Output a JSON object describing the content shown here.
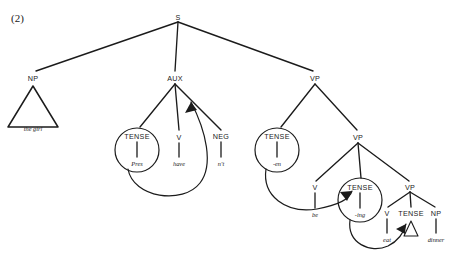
{
  "example": {
    "number": "(2)"
  },
  "tree": {
    "type": "syntax-tree",
    "description": "Phrase structure tree with affix hopping arrows",
    "nodes": [
      {
        "id": "s",
        "label": "S",
        "x": 178,
        "y": 17,
        "circled": false
      },
      {
        "id": "np",
        "label": "NP",
        "x": 33,
        "y": 78,
        "circled": false
      },
      {
        "id": "aux",
        "label": "AUX",
        "x": 175,
        "y": 78,
        "circled": false
      },
      {
        "id": "vp1",
        "label": "VP",
        "x": 315,
        "y": 78,
        "circled": false
      },
      {
        "id": "tense1",
        "label": "TENSE",
        "x": 137,
        "y": 136,
        "circled": true
      },
      {
        "id": "v1",
        "label": "V",
        "x": 179,
        "y": 137,
        "circled": false
      },
      {
        "id": "neg",
        "label": "NEG",
        "x": 221,
        "y": 136,
        "circled": false
      },
      {
        "id": "tense2",
        "label": "TENSE",
        "x": 277,
        "y": 136,
        "circled": true
      },
      {
        "id": "vp2",
        "label": "VP",
        "x": 358,
        "y": 137,
        "circled": false
      },
      {
        "id": "v2",
        "label": "V",
        "x": 315,
        "y": 187,
        "circled": false
      },
      {
        "id": "tense3",
        "label": "TENSE",
        "x": 360,
        "y": 187,
        "circled": true
      },
      {
        "id": "vp3",
        "label": "VP",
        "x": 410,
        "y": 187,
        "circled": false
      },
      {
        "id": "v3",
        "label": "V",
        "x": 387,
        "y": 213,
        "circled": false
      },
      {
        "id": "tense4",
        "label": "TENSE",
        "x": 411,
        "y": 213,
        "circled": false
      },
      {
        "id": "np2",
        "label": "NP",
        "x": 436,
        "y": 213,
        "circled": false
      }
    ],
    "terminals": [
      {
        "id": "t-girl",
        "label": "the girl",
        "x": 33,
        "y": 128
      },
      {
        "id": "t-pres",
        "label": "Pres",
        "x": 137,
        "y": 164
      },
      {
        "id": "t-have",
        "label": "have",
        "x": 179,
        "y": 164
      },
      {
        "id": "t-nt",
        "label": "n't",
        "x": 221,
        "y": 164
      },
      {
        "id": "t-en",
        "label": "-en",
        "x": 277,
        "y": 164
      },
      {
        "id": "t-be",
        "label": "be",
        "x": 315,
        "y": 215
      },
      {
        "id": "t-ing",
        "label": "-ing",
        "x": 360,
        "y": 215
      },
      {
        "id": "t-eat",
        "label": "eat",
        "x": 387,
        "y": 240
      },
      {
        "id": "t-dinner",
        "label": "dinner",
        "x": 436,
        "y": 240
      }
    ],
    "branches": [
      {
        "from": "s",
        "to": "np"
      },
      {
        "from": "s",
        "to": "aux"
      },
      {
        "from": "s",
        "to": "vp1"
      },
      {
        "from": "aux",
        "to": "tense1"
      },
      {
        "from": "aux",
        "to": "v1"
      },
      {
        "from": "aux",
        "to": "neg"
      },
      {
        "from": "vp1",
        "to": "tense2"
      },
      {
        "from": "vp1",
        "to": "vp2"
      },
      {
        "from": "vp2",
        "to": "v2"
      },
      {
        "from": "vp2",
        "to": "tense3"
      },
      {
        "from": "vp2",
        "to": "vp3"
      },
      {
        "from": "vp3",
        "to": "v3"
      },
      {
        "from": "vp3",
        "to": "tense4"
      },
      {
        "from": "vp3",
        "to": "np2"
      }
    ],
    "movement_arrows": [
      {
        "id": "hop-pres-have",
        "note": "Pres hops onto have"
      },
      {
        "id": "hop-en-be",
        "note": "-en hops onto be"
      },
      {
        "id": "hop-ing-eat",
        "note": "-ing hops onto eat"
      }
    ],
    "triangles": [
      {
        "id": "np-triangle",
        "note": "the girl"
      },
      {
        "id": "tense-triangle",
        "note": "null tense"
      }
    ]
  },
  "colors": {
    "ink": "#1b1b1b",
    "background": "#ffffff"
  }
}
